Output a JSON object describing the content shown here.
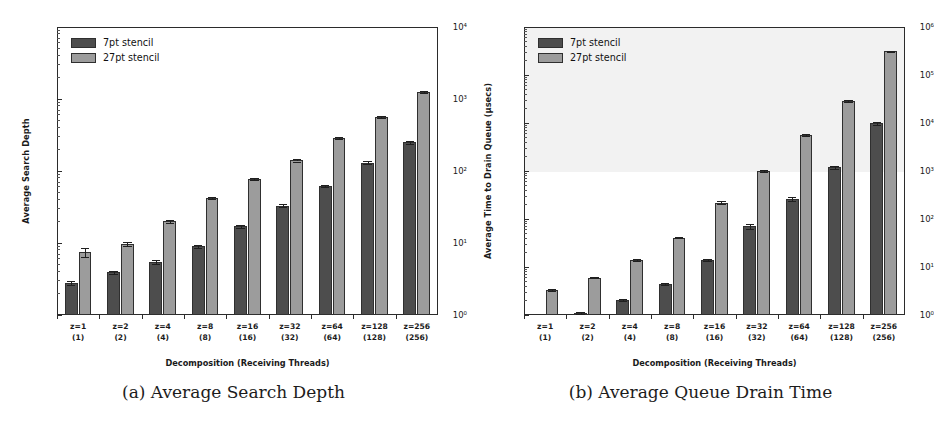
{
  "figure": {
    "panels": [
      {
        "id": "panel-a",
        "caption": "(a) Average Search Depth"
      },
      {
        "id": "panel-b",
        "caption": "(b) Average Queue Drain Time"
      }
    ]
  },
  "legend": {
    "entries": [
      {
        "label": "7pt stencil",
        "color": "#4d4d4d"
      },
      {
        "label": "27pt stencil",
        "color": "#9c9c9c"
      }
    ]
  },
  "colors": {
    "series_7pt": "#4d4d4d",
    "series_27pt": "#9c9c9c",
    "axis": "#2b2b2b",
    "shade_band": "#f2f2f2",
    "background": "#ffffff"
  },
  "axis_labels": {
    "x_common": "Decomposition (Receiving Threads)",
    "y_a": "Average Search Depth",
    "y_b": "Average Time to Drain Queue (µsecs)"
  },
  "x_ticks": [
    {
      "top": "z=1",
      "bottom": "(1)"
    },
    {
      "top": "z=2",
      "bottom": "(2)"
    },
    {
      "top": "z=4",
      "bottom": "(4)"
    },
    {
      "top": "z=8",
      "bottom": "(8)"
    },
    {
      "top": "z=16",
      "bottom": "(16)"
    },
    {
      "top": "z=32",
      "bottom": "(32)"
    },
    {
      "top": "z=64",
      "bottom": "(64)"
    },
    {
      "top": "z=128",
      "bottom": "(128)"
    },
    {
      "top": "z=256",
      "bottom": "(256)"
    }
  ],
  "y_ticks_a": [
    "10⁰",
    "10¹",
    "10²",
    "10³",
    "10⁴"
  ],
  "y_ticks_b": [
    "10⁰",
    "10¹",
    "10²",
    "10³",
    "10⁴",
    "10⁵",
    "10⁶"
  ],
  "chart_data": [
    {
      "type": "bar",
      "title": "(a) Average Search Depth",
      "xlabel": "Decomposition (Receiving Threads)",
      "ylabel": "Average Search Depth",
      "yscale": "log",
      "ylim": [
        1,
        10000
      ],
      "ytick_values": [
        1,
        10,
        100,
        1000,
        10000
      ],
      "ytick_labels": [
        "10⁰",
        "10¹",
        "10²",
        "10³",
        "10⁴"
      ],
      "grid": false,
      "legend_position": "upper left",
      "categories": [
        "z=1 (1)",
        "z=2 (2)",
        "z=4 (4)",
        "z=8 (8)",
        "z=16 (16)",
        "z=32 (32)",
        "z=64 (64)",
        "z=128 (128)",
        "z=256 (256)"
      ],
      "series": [
        {
          "name": "7pt stencil",
          "color": "#4d4d4d",
          "values": [
            2.8,
            3.9,
            5.4,
            9.0,
            17,
            33,
            62,
            130,
            250
          ],
          "errors": [
            0.15,
            0.2,
            0.35,
            0.5,
            0.8,
            1.5,
            2.5,
            6,
            14
          ]
        },
        {
          "name": "27pt stencil",
          "color": "#9c9c9c",
          "values": [
            7.5,
            9.8,
            20,
            42,
            78,
            140,
            290,
            570,
            1250
          ],
          "errors": [
            1.1,
            0.6,
            0.9,
            1.6,
            2.5,
            4.5,
            9,
            18,
            55
          ]
        }
      ]
    },
    {
      "type": "bar",
      "title": "(b) Average Queue Drain Time",
      "xlabel": "Decomposition (Receiving Threads)",
      "ylabel": "Average Time to Drain Queue (µsecs)",
      "yscale": "log",
      "ylim": [
        1,
        1000000
      ],
      "ytick_values": [
        1,
        10,
        100,
        1000,
        10000,
        100000,
        1000000
      ],
      "ytick_labels": [
        "10⁰",
        "10¹",
        "10²",
        "10³",
        "10⁴",
        "10⁵",
        "10⁶"
      ],
      "grid": false,
      "legend_position": "upper left",
      "categories": [
        "z=1 (1)",
        "z=2 (2)",
        "z=4 (4)",
        "z=8 (8)",
        "z=16 (16)",
        "z=32 (32)",
        "z=64 (64)",
        "z=128 (128)",
        "z=256 (256)"
      ],
      "series": [
        {
          "name": "7pt stencil",
          "color": "#4d4d4d",
          "values": [
            null,
            1.1,
            2.1,
            4.5,
            14,
            70,
            260,
            1200,
            9800
          ],
          "errors": [
            null,
            0.05,
            0.1,
            0.2,
            0.8,
            8,
            22,
            90,
            700
          ]
        },
        {
          "name": "27pt stencil",
          "color": "#9c9c9c",
          "values": [
            3.3,
            6.0,
            14,
            41,
            220,
            1000,
            5500,
            29000,
            310000
          ],
          "errors": [
            0.1,
            0.2,
            0.4,
            1.2,
            18,
            55,
            260,
            1400,
            12000
          ]
        }
      ]
    }
  ]
}
